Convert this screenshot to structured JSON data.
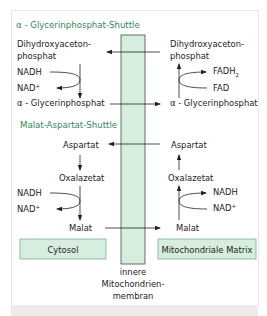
{
  "sections": {
    "glycerophosphate": {
      "title": "α - Glycerinphosphat-Shuttle",
      "left": {
        "dhap_line1": "Dihydroxyaceton-",
        "dhap_line2": "phosphat",
        "nadh": "NADH",
        "nad": "NAD",
        "nad_sup": "+",
        "g3p": "α - Glycerinphosphat"
      },
      "right": {
        "dhap_line1": "Dihydroxyaceton-",
        "dhap_line2": "phosphat",
        "fadh": "FADH",
        "fadh_sub": "2",
        "fad": "FAD",
        "g3p": "α - Glycerinphosphat"
      }
    },
    "malate_aspartate": {
      "title": "Malat-Aspartat-Shuttle",
      "left": {
        "aspartate": "Aspartat",
        "oxaloacetate": "Oxalazetat",
        "nadh": "NADH",
        "nad": "NAD",
        "nad_sup": "+",
        "malate": "Malat"
      },
      "right": {
        "aspartate": "Aspartat",
        "oxaloacetate": "Oxalazetat",
        "nadh": "NADH",
        "nad": "NAD",
        "nad_sup": "+",
        "malate": "Malat"
      }
    }
  },
  "compartments": {
    "cytosol": "Cytosol",
    "matrix": "Mitochondriale Matrix"
  },
  "membrane_label": {
    "line1": "innere",
    "line2": "Mitochondrien-",
    "line3": "membran"
  },
  "colors": {
    "heading": "#2e8b57",
    "membrane_fill": "#d6eedd",
    "box_fill": "#d6eedd",
    "box_border": "#7fae8c",
    "line": "#222222"
  }
}
